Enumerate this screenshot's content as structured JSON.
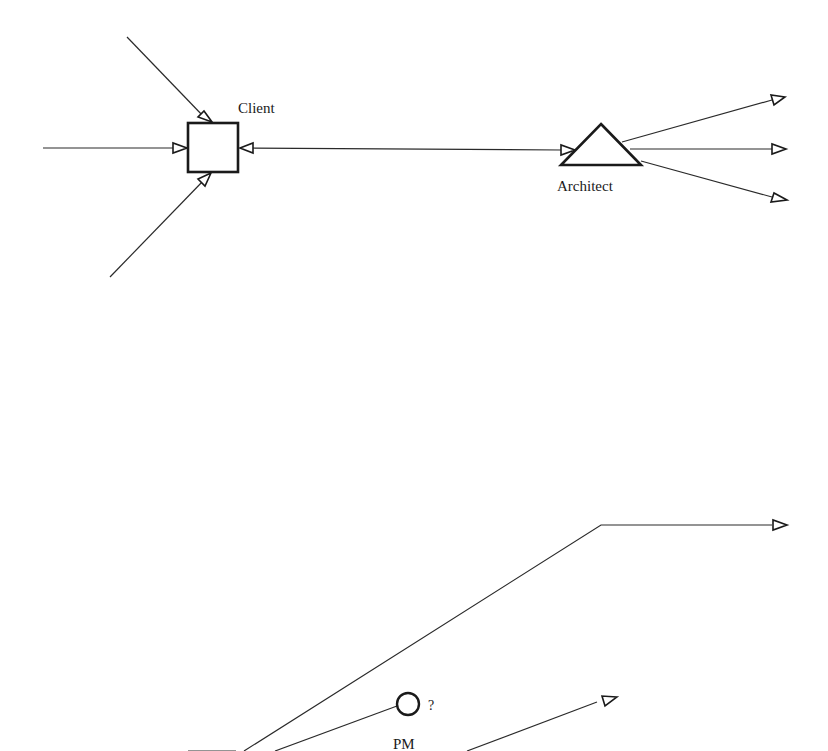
{
  "diagram": {
    "top": {
      "client": {
        "label": "Client",
        "shape": "square"
      },
      "architect": {
        "label": "Architect",
        "shape": "triangle"
      }
    },
    "bottom": {
      "pm": {
        "label": "PM",
        "annotation": "?",
        "shape": "circle"
      }
    }
  },
  "colors": {
    "ink": "#1a1a1a",
    "background": "#ffffff"
  }
}
